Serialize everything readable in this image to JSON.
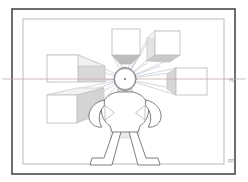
{
  "document": {
    "title": "One-Point Perspective Construction",
    "background_color": "#ffffff",
    "canvas_width": 248,
    "canvas_height": 182
  },
  "frame": {
    "outer_border": {
      "name": "outer-page-border",
      "x": 12,
      "y": 9,
      "width": 223,
      "height": 165,
      "stroke": "#4a4a4a",
      "stroke_width": 1.6,
      "fill": "none"
    },
    "inner_border": {
      "name": "inner-drawing-frame",
      "x": 23,
      "y": 19,
      "width": 201,
      "height": 145,
      "stroke": "#b9b9b9",
      "stroke_width": 1.0,
      "fill": "none"
    }
  },
  "labels": {
    "horizon_line": "HL",
    "picture_plane": "PP",
    "horizon_label_color": "#9a9a9a",
    "picture_plane_label_color": "#9a9a9a"
  },
  "horizon_line": {
    "name": "horizon-line",
    "y": 79,
    "x_start": 2,
    "x_end": 246,
    "stroke": "#c2a9a9",
    "stroke_width": 0.8
  },
  "vanishing_point": {
    "name": "vanishing-point",
    "cx": 125,
    "cy": 79,
    "radius": 10.5,
    "stroke": "#8e8e9e",
    "stroke_width": 0.9,
    "fill": "none",
    "ray_color": "#a9a9bb",
    "ray_width": 0.55,
    "ray_count": 22
  },
  "boxes": [
    {
      "name": "box-top-center",
      "position": "top-center",
      "front_x": 112,
      "front_y": 29,
      "front_w": 28,
      "front_h": 26,
      "face_fill": "#ffffff",
      "stroke": "#c0c0c0",
      "shade_fill": "#bdbdbd",
      "visible_faces": [
        "front",
        "bottom"
      ]
    },
    {
      "name": "box-top-right",
      "position": "top-right",
      "front_x": 155,
      "front_y": 31,
      "front_w": 25,
      "front_h": 24,
      "face_fill": "#ffffff",
      "stroke": "#c0c0c0",
      "shade_fill": "#d2d2d2",
      "visible_faces": [
        "front",
        "left",
        "bottom"
      ]
    },
    {
      "name": "box-left-upper",
      "position": "left-upper",
      "front_x": 47,
      "front_y": 55,
      "front_w": 31,
      "front_h": 27,
      "face_fill": "#ffffff",
      "stroke": "#c0c0c0",
      "shade_fill": "#d8d8d8",
      "visible_faces": [
        "front",
        "right"
      ]
    },
    {
      "name": "box-left-lower",
      "position": "left-lower",
      "front_x": 47,
      "front_y": 95,
      "front_w": 30,
      "front_h": 28,
      "face_fill": "#ffffff",
      "stroke": "#c0c0c0",
      "shade_fill": "#d4d4d4",
      "visible_faces": [
        "front",
        "right",
        "top"
      ]
    },
    {
      "name": "box-right",
      "position": "right",
      "front_x": 176,
      "front_y": 68,
      "front_w": 31,
      "front_h": 27,
      "face_fill": "#ffffff",
      "stroke": "#c0c0c0",
      "shade_fill": "#d6d6d6",
      "visible_faces": [
        "front",
        "left"
      ]
    }
  ],
  "figure": {
    "name": "human-figure",
    "stroke": "#6f6f6f",
    "stroke_width": 0.9,
    "fill": "#ffffff",
    "head_cx": 125,
    "head_cy": 79,
    "torso_box_fill": "#ebebeb"
  },
  "palette": {
    "line_gray": "#c0c0c0",
    "figure_gray": "#6f6f6f",
    "border_dark": "#4a4a4a",
    "border_light": "#b9b9b9",
    "horizon_pink": "#c2a9a9",
    "ray_blue_gray": "#a9a9bb"
  }
}
